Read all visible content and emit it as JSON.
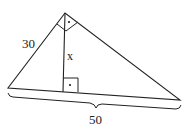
{
  "diagram": {
    "type": "right-triangle-with-altitude",
    "labels": {
      "leg": "30",
      "altitude": "x",
      "hypotenuse": "50"
    },
    "right_angle_markers": [
      "apex",
      "altitude-foot"
    ],
    "colors": {
      "stroke": "#222222",
      "background": "#ffffff"
    }
  }
}
